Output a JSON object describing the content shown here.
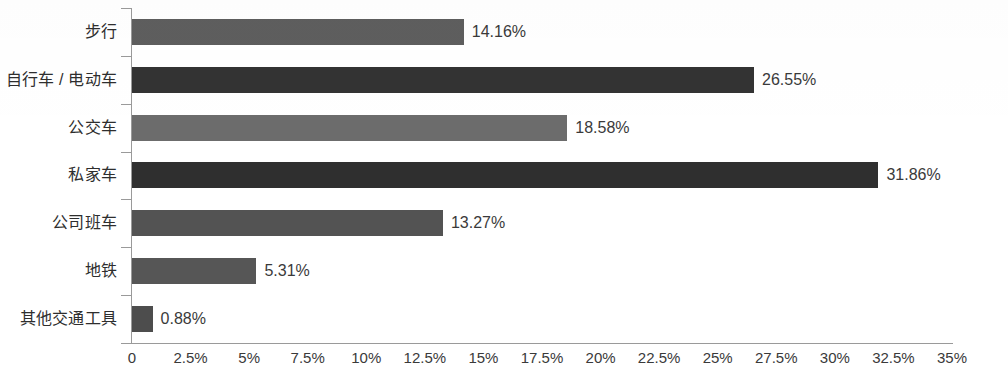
{
  "chart_data": {
    "type": "bar",
    "orientation": "horizontal",
    "title": "",
    "xlabel": "",
    "ylabel": "",
    "categories": [
      "步行",
      "自行车 / 电动车",
      "公交车",
      "私家车",
      "公司班车",
      "地铁",
      "其他交通工具"
    ],
    "values": [
      14.16,
      26.55,
      18.58,
      31.86,
      13.27,
      5.31,
      0.88
    ],
    "value_labels": [
      "14.16%",
      "26.55%",
      "18.58%",
      "31.86%",
      "13.27%",
      "5.31%",
      "0.88%"
    ],
    "bar_colors": [
      "#5e5e5e",
      "#333333",
      "#6c6c6c",
      "#2f2f2f",
      "#535353",
      "#565656",
      "#4d4d4d"
    ],
    "xlim": [
      0,
      35
    ],
    "xticks": [
      0,
      2.5,
      5,
      7.5,
      10,
      12.5,
      15,
      17.5,
      20,
      22.5,
      25,
      27.5,
      30,
      32.5,
      35
    ],
    "xtick_labels": [
      "0",
      "2.5%",
      "5%",
      "7.5%",
      "10%",
      "12.5%",
      "15%",
      "17.5%",
      "20%",
      "22.5%",
      "25%",
      "27.5%",
      "30%",
      "32.5%",
      "35%"
    ],
    "grid": false,
    "legend": false,
    "axis_color": "#9a9a9a",
    "background": "#ffffff"
  }
}
